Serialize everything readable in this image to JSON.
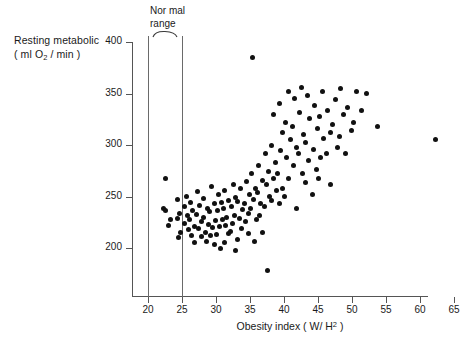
{
  "axes": {
    "y_title_line1": "Resting metabolic",
    "y_title_line2_pre": "( ml O",
    "y_title_line2_sub": "2",
    "y_title_line2_post": " / min )",
    "x_title_pre": "Obesity index ( W/ H",
    "x_title_sup": "2",
    "x_title_post": " )"
  },
  "annotation": {
    "normal_range_line1": "Nor mal",
    "normal_range_line2": "range",
    "normal_range_low": 20,
    "normal_range_high": 25
  },
  "chart_data": {
    "type": "scatter",
    "title": "",
    "xlabel": "Obesity index (W/H2)",
    "ylabel": "Resting metabolic (ml O2 / min)",
    "xlim": [
      20,
      65
    ],
    "ylim": [
      170,
      400
    ],
    "xticks": [
      20,
      25,
      30,
      35,
      40,
      45,
      50,
      55,
      60,
      65
    ],
    "yticks": [
      200,
      250,
      300,
      350,
      400
    ],
    "grid": false,
    "legend": null,
    "marker": "filled-circle",
    "marker_color": "#111111",
    "annotations": [
      {
        "type": "vline",
        "x": 20,
        "label": "normal range lower bound"
      },
      {
        "type": "vline",
        "x": 25,
        "label": "normal range upper bound"
      },
      {
        "type": "brace",
        "x_from": 20,
        "x_to": 25,
        "label": "Normal range"
      }
    ],
    "n_points": 125,
    "points": [
      [
        22.6,
        268
      ],
      [
        22.2,
        238
      ],
      [
        22.5,
        236
      ],
      [
        23.3,
        228
      ],
      [
        23.0,
        222
      ],
      [
        24.3,
        247
      ],
      [
        24.6,
        234
      ],
      [
        24.4,
        229
      ],
      [
        24.8,
        215
      ],
      [
        24.5,
        210
      ],
      [
        25.6,
        250
      ],
      [
        25.3,
        240
      ],
      [
        25.8,
        232
      ],
      [
        25.4,
        224
      ],
      [
        25.9,
        218
      ],
      [
        26.2,
        244
      ],
      [
        26.6,
        236
      ],
      [
        26.1,
        228
      ],
      [
        26.8,
        221
      ],
      [
        26.4,
        212
      ],
      [
        26.9,
        205
      ],
      [
        27.3,
        255
      ],
      [
        27.6,
        241
      ],
      [
        27.1,
        233
      ],
      [
        27.8,
        226
      ],
      [
        27.4,
        219
      ],
      [
        27.9,
        211
      ],
      [
        28.2,
        248
      ],
      [
        28.7,
        238
      ],
      [
        28.1,
        230
      ],
      [
        28.9,
        223
      ],
      [
        28.4,
        215
      ],
      [
        28.6,
        206
      ],
      [
        29.3,
        260
      ],
      [
        29.7,
        243
      ],
      [
        29.1,
        235
      ],
      [
        29.9,
        227
      ],
      [
        29.5,
        220
      ],
      [
        29.2,
        212
      ],
      [
        29.8,
        203
      ],
      [
        30.4,
        252
      ],
      [
        30.8,
        244
      ],
      [
        30.2,
        236
      ],
      [
        30.9,
        228
      ],
      [
        30.5,
        221
      ],
      [
        30.1,
        213
      ],
      [
        30.7,
        200
      ],
      [
        31.3,
        256
      ],
      [
        31.8,
        246
      ],
      [
        31.1,
        238
      ],
      [
        31.6,
        230
      ],
      [
        31.4,
        222
      ],
      [
        31.9,
        214
      ],
      [
        31.2,
        205
      ],
      [
        32.5,
        262
      ],
      [
        32.9,
        249
      ],
      [
        32.2,
        240
      ],
      [
        32.7,
        232
      ],
      [
        32.4,
        224
      ],
      [
        32.1,
        216
      ],
      [
        32.8,
        198
      ],
      [
        33.6,
        258
      ],
      [
        33.2,
        245
      ],
      [
        33.9,
        237
      ],
      [
        33.4,
        229
      ],
      [
        33.7,
        219
      ],
      [
        33.1,
        208
      ],
      [
        34.5,
        265
      ],
      [
        34.9,
        252
      ],
      [
        34.2,
        243
      ],
      [
        34.7,
        234
      ],
      [
        34.3,
        226
      ],
      [
        34.8,
        214
      ],
      [
        35.4,
        385
      ],
      [
        35.2,
        272
      ],
      [
        35.8,
        258
      ],
      [
        35.5,
        247
      ],
      [
        35.1,
        238
      ],
      [
        35.9,
        228
      ],
      [
        35.6,
        206
      ],
      [
        36.3,
        280
      ],
      [
        36.8,
        266
      ],
      [
        36.1,
        254
      ],
      [
        36.6,
        243
      ],
      [
        36.4,
        232
      ],
      [
        36.9,
        215
      ],
      [
        37.2,
        292
      ],
      [
        37.7,
        274
      ],
      [
        37.4,
        262
      ],
      [
        37.9,
        250
      ],
      [
        37.1,
        240
      ],
      [
        37.6,
        178
      ],
      [
        38.5,
        330
      ],
      [
        38.2,
        300
      ],
      [
        38.8,
        283
      ],
      [
        38.4,
        268
      ],
      [
        38.9,
        256
      ],
      [
        38.1,
        246
      ],
      [
        39.3,
        340
      ],
      [
        39.8,
        312
      ],
      [
        39.5,
        295
      ],
      [
        39.1,
        272
      ],
      [
        39.7,
        258
      ],
      [
        39.4,
        243
      ],
      [
        40.6,
        352
      ],
      [
        40.2,
        322
      ],
      [
        40.9,
        305
      ],
      [
        40.4,
        288
      ],
      [
        40.7,
        268
      ],
      [
        40.1,
        250
      ],
      [
        41.5,
        345
      ],
      [
        41.2,
        318
      ],
      [
        41.8,
        298
      ],
      [
        41.4,
        280
      ],
      [
        41.9,
        238
      ],
      [
        42.6,
        356
      ],
      [
        42.3,
        332
      ],
      [
        42.9,
        310
      ],
      [
        42.1,
        292
      ],
      [
        42.7,
        272
      ],
      [
        43.4,
        348
      ],
      [
        43.8,
        326
      ],
      [
        43.2,
        302
      ],
      [
        43.6,
        285
      ],
      [
        43.1,
        264
      ],
      [
        44.5,
        338
      ],
      [
        44.9,
        316
      ],
      [
        44.3,
        296
      ],
      [
        44.7,
        276
      ],
      [
        44.2,
        252
      ],
      [
        45.6,
        352
      ],
      [
        45.2,
        328
      ],
      [
        45.8,
        306
      ],
      [
        45.4,
        288
      ],
      [
        45.1,
        268
      ],
      [
        46.4,
        334
      ],
      [
        46.8,
        312
      ],
      [
        46.2,
        292
      ],
      [
        46.9,
        262
      ],
      [
        47.5,
        344
      ],
      [
        47.1,
        320
      ],
      [
        47.8,
        298
      ],
      [
        48.3,
        355
      ],
      [
        48.7,
        330
      ],
      [
        48.2,
        308
      ],
      [
        49.4,
        336
      ],
      [
        49.9,
        314
      ],
      [
        49.1,
        292
      ],
      [
        50.6,
        352
      ],
      [
        50.2,
        322
      ],
      [
        51.4,
        334
      ],
      [
        52.1,
        350
      ],
      [
        53.8,
        318
      ],
      [
        62.2,
        305
      ]
    ]
  }
}
